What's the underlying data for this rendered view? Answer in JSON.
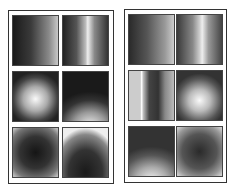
{
  "figure": {
    "panels": [
      {
        "name": "left",
        "tiles": [
          {
            "pattern": "horizontal-ramp-dark-to-light"
          },
          {
            "pattern": "vertical-bright-stripe"
          },
          {
            "pattern": "radial-bright-center-left"
          },
          {
            "pattern": "vertical-ramp-bright-bottom"
          },
          {
            "pattern": "dark-center-bright-corners"
          },
          {
            "pattern": "bright-top-dark-bottom-arc"
          }
        ]
      },
      {
        "name": "right",
        "tiles": [
          {
            "pattern": "horizontal-ramp-dark-to-light"
          },
          {
            "pattern": "vertical-bright-stripe"
          },
          {
            "pattern": "vertical-multiple-stripes"
          },
          {
            "pattern": "radial-bright-center"
          },
          {
            "pattern": "vertical-ramp-bright-bottom"
          },
          {
            "pattern": "dark-center-bright-edges"
          }
        ]
      }
    ]
  }
}
